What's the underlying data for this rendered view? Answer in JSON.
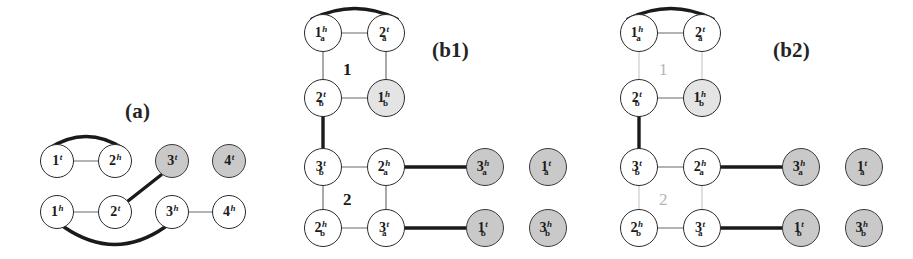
{
  "figure": {
    "background": "#ffffff",
    "colors": {
      "node_fill_white": "#ffffff",
      "node_fill_gray": "#c9c9c9",
      "node_stroke": "#2a2a2a",
      "thick_edge": "#1a1a1a",
      "thin_edge": "#9a9a9a",
      "faded_edge": "#d8d8d8",
      "faded_label": "#b4b4b4",
      "label_text": "#242424"
    }
  },
  "panels": [
    {
      "id": "a",
      "label": "(a)",
      "x": 125,
      "y": 99
    },
    {
      "id": "b1",
      "label": "(b1)",
      "x": 432,
      "y": 38
    },
    {
      "id": "b2",
      "label": "(b2)",
      "x": 773,
      "y": 38
    }
  ],
  "group_labels": [
    {
      "id": "b1-group-1",
      "text": "1",
      "x": 343,
      "y": 60,
      "color": "#1a1a1a",
      "faded": false
    },
    {
      "id": "b1-group-2",
      "text": "2",
      "x": 343,
      "y": 190,
      "color": "#1a1a1a",
      "faded": false
    },
    {
      "id": "b2-group-1",
      "text": "1",
      "x": 659,
      "y": 60,
      "color": "#b4b4b4",
      "faded": true
    },
    {
      "id": "b2-group-2",
      "text": "2",
      "x": 659,
      "y": 190,
      "color": "#b4b4b4",
      "faded": true
    }
  ],
  "nodes": [
    {
      "id": "a-1t",
      "panel": "a",
      "num": "1",
      "sup": "t",
      "sub": "",
      "cx": 57,
      "cy": 161,
      "r": 17,
      "shaded": false
    },
    {
      "id": "a-2h",
      "panel": "a",
      "num": "2",
      "sup": "h",
      "sub": "",
      "cx": 115,
      "cy": 161,
      "r": 17,
      "shaded": false
    },
    {
      "id": "a-3t",
      "panel": "a",
      "num": "3",
      "sup": "t",
      "sub": "",
      "cx": 172,
      "cy": 161,
      "r": 17,
      "shaded": true
    },
    {
      "id": "a-4t",
      "panel": "a",
      "num": "4",
      "sup": "t",
      "sub": "",
      "cx": 229,
      "cy": 161,
      "r": 17,
      "shaded": true
    },
    {
      "id": "a-1h",
      "panel": "a",
      "num": "1",
      "sup": "h",
      "sub": "",
      "cx": 57,
      "cy": 212,
      "r": 17,
      "shaded": false
    },
    {
      "id": "a-2t",
      "panel": "a",
      "num": "2",
      "sup": "t",
      "sub": "",
      "cx": 115,
      "cy": 212,
      "r": 17,
      "shaded": false
    },
    {
      "id": "a-3h",
      "panel": "a",
      "num": "3",
      "sup": "h",
      "sub": "",
      "cx": 172,
      "cy": 212,
      "r": 17,
      "shaded": false
    },
    {
      "id": "a-4h",
      "panel": "a",
      "num": "4",
      "sup": "h",
      "sub": "",
      "cx": 229,
      "cy": 212,
      "r": 17,
      "shaded": false
    },
    {
      "id": "b1-1ah",
      "panel": "b1",
      "num": "1",
      "sup": "h",
      "sub": "a",
      "cx": 323,
      "cy": 33,
      "r": 19,
      "shaded": false
    },
    {
      "id": "b1-2at",
      "panel": "b1",
      "num": "2",
      "sup": "t",
      "sub": "a",
      "cx": 386,
      "cy": 33,
      "r": 19,
      "shaded": false
    },
    {
      "id": "b1-2bt",
      "panel": "b1",
      "num": "2",
      "sup": "t",
      "sub": "b",
      "cx": 323,
      "cy": 98,
      "r": 19,
      "shaded": false
    },
    {
      "id": "b1-1bh",
      "panel": "b1",
      "num": "1",
      "sup": "h",
      "sub": "b",
      "cx": 386,
      "cy": 98,
      "r": 19,
      "shaded": false,
      "faint": true
    },
    {
      "id": "b1-3bt",
      "panel": "b1",
      "num": "3",
      "sup": "t",
      "sub": "b",
      "cx": 323,
      "cy": 167,
      "r": 19,
      "shaded": false
    },
    {
      "id": "b1-2ah",
      "panel": "b1",
      "num": "2",
      "sup": "h",
      "sub": "a",
      "cx": 386,
      "cy": 167,
      "r": 19,
      "shaded": false
    },
    {
      "id": "b1-3ah",
      "panel": "b1",
      "num": "3",
      "sup": "h",
      "sub": "a",
      "cx": 485,
      "cy": 167,
      "r": 19,
      "shaded": true
    },
    {
      "id": "b1-1at",
      "panel": "b1",
      "num": "1",
      "sup": "t",
      "sub": "a",
      "cx": 548,
      "cy": 167,
      "r": 19,
      "shaded": true
    },
    {
      "id": "b1-2bh",
      "panel": "b1",
      "num": "2",
      "sup": "h",
      "sub": "b",
      "cx": 323,
      "cy": 228,
      "r": 19,
      "shaded": false
    },
    {
      "id": "b1-3at",
      "panel": "b1",
      "num": "3",
      "sup": "t",
      "sub": "a",
      "cx": 386,
      "cy": 228,
      "r": 19,
      "shaded": false
    },
    {
      "id": "b1-1bt",
      "panel": "b1",
      "num": "1",
      "sup": "t",
      "sub": "b",
      "cx": 485,
      "cy": 228,
      "r": 19,
      "shaded": true
    },
    {
      "id": "b1-3bh",
      "panel": "b1",
      "num": "3",
      "sup": "h",
      "sub": "b",
      "cx": 548,
      "cy": 228,
      "r": 19,
      "shaded": true
    },
    {
      "id": "b2-1ah",
      "panel": "b2",
      "num": "1",
      "sup": "h",
      "sub": "a",
      "cx": 639,
      "cy": 33,
      "r": 19,
      "shaded": false
    },
    {
      "id": "b2-2at",
      "panel": "b2",
      "num": "2",
      "sup": "t",
      "sub": "a",
      "cx": 702,
      "cy": 33,
      "r": 19,
      "shaded": false
    },
    {
      "id": "b2-2bt",
      "panel": "b2",
      "num": "2",
      "sup": "t",
      "sub": "b",
      "cx": 639,
      "cy": 98,
      "r": 19,
      "shaded": false
    },
    {
      "id": "b2-1bh",
      "panel": "b2",
      "num": "1",
      "sup": "h",
      "sub": "b",
      "cx": 702,
      "cy": 98,
      "r": 19,
      "shaded": false,
      "faint": true
    },
    {
      "id": "b2-3bt",
      "panel": "b2",
      "num": "3",
      "sup": "t",
      "sub": "b",
      "cx": 639,
      "cy": 167,
      "r": 19,
      "shaded": false
    },
    {
      "id": "b2-2ah",
      "panel": "b2",
      "num": "2",
      "sup": "h",
      "sub": "a",
      "cx": 702,
      "cy": 167,
      "r": 19,
      "shaded": false
    },
    {
      "id": "b2-3ah",
      "panel": "b2",
      "num": "3",
      "sup": "h",
      "sub": "a",
      "cx": 801,
      "cy": 167,
      "r": 19,
      "shaded": true
    },
    {
      "id": "b2-1at",
      "panel": "b2",
      "num": "1",
      "sup": "t",
      "sub": "a",
      "cx": 864,
      "cy": 167,
      "r": 19,
      "shaded": true
    },
    {
      "id": "b2-2bh",
      "panel": "b2",
      "num": "2",
      "sup": "h",
      "sub": "b",
      "cx": 639,
      "cy": 228,
      "r": 19,
      "shaded": false
    },
    {
      "id": "b2-3at",
      "panel": "b2",
      "num": "3",
      "sup": "t",
      "sub": "a",
      "cx": 702,
      "cy": 228,
      "r": 19,
      "shaded": false
    },
    {
      "id": "b2-1bt",
      "panel": "b2",
      "num": "1",
      "sup": "t",
      "sub": "b",
      "cx": 801,
      "cy": 228,
      "r": 19,
      "shaded": true
    },
    {
      "id": "b2-3bh",
      "panel": "b2",
      "num": "3",
      "sup": "h",
      "sub": "b",
      "cx": 864,
      "cy": 228,
      "r": 19,
      "shaded": true
    }
  ],
  "edges": [
    {
      "id": "a-e1",
      "panel": "a",
      "kind": "thin",
      "type": "line",
      "from": [
        74,
        161
      ],
      "to": [
        98,
        161
      ]
    },
    {
      "id": "a-e2",
      "panel": "a",
      "kind": "thick",
      "type": "arc",
      "d": "M 48 149 Q 86 124 124 149"
    },
    {
      "id": "a-e3",
      "panel": "a",
      "kind": "thin",
      "type": "line",
      "from": [
        74,
        212
      ],
      "to": [
        98,
        212
      ]
    },
    {
      "id": "a-e4",
      "panel": "a",
      "kind": "thin",
      "type": "line",
      "from": [
        189,
        212
      ],
      "to": [
        212,
        212
      ]
    },
    {
      "id": "a-e5",
      "panel": "a",
      "kind": "thick",
      "type": "line",
      "from": [
        128,
        201
      ],
      "to": [
        161,
        175
      ]
    },
    {
      "id": "a-e6",
      "panel": "a",
      "kind": "thick",
      "type": "arc",
      "d": "M 64 227 Q 115 262 165 227"
    },
    {
      "id": "b1-e1",
      "panel": "b1",
      "kind": "thin",
      "type": "line",
      "from": [
        342,
        33
      ],
      "to": [
        367,
        33
      ]
    },
    {
      "id": "b1-e2",
      "panel": "b1",
      "kind": "thick",
      "type": "arc",
      "d": "M 312 19 Q 355 -2 397 19"
    },
    {
      "id": "b1-e3",
      "panel": "b1",
      "kind": "thin",
      "type": "line",
      "from": [
        323,
        52
      ],
      "to": [
        323,
        79
      ]
    },
    {
      "id": "b1-e4",
      "panel": "b1",
      "kind": "thin",
      "type": "line",
      "from": [
        386,
        52
      ],
      "to": [
        386,
        79
      ]
    },
    {
      "id": "b1-e5",
      "panel": "b1",
      "kind": "thin",
      "type": "line",
      "from": [
        342,
        98
      ],
      "to": [
        367,
        98
      ]
    },
    {
      "id": "b1-e6",
      "panel": "b1",
      "kind": "thick",
      "type": "line",
      "from": [
        323,
        117
      ],
      "to": [
        323,
        148
      ]
    },
    {
      "id": "b1-e7",
      "panel": "b1",
      "kind": "thin",
      "type": "line",
      "from": [
        342,
        167
      ],
      "to": [
        367,
        167
      ]
    },
    {
      "id": "b1-e8",
      "panel": "b1",
      "kind": "thick",
      "type": "line",
      "from": [
        405,
        167
      ],
      "to": [
        466,
        167
      ]
    },
    {
      "id": "b1-e9",
      "panel": "b1",
      "kind": "thin",
      "type": "line",
      "from": [
        323,
        186
      ],
      "to": [
        323,
        209
      ]
    },
    {
      "id": "b1-e10",
      "panel": "b1",
      "kind": "thin",
      "type": "line",
      "from": [
        386,
        186
      ],
      "to": [
        386,
        209
      ]
    },
    {
      "id": "b1-e11",
      "panel": "b1",
      "kind": "thin",
      "type": "line",
      "from": [
        342,
        228
      ],
      "to": [
        367,
        228
      ]
    },
    {
      "id": "b1-e12",
      "panel": "b1",
      "kind": "thick",
      "type": "line",
      "from": [
        405,
        228
      ],
      "to": [
        466,
        228
      ]
    },
    {
      "id": "b2-e1",
      "panel": "b2",
      "kind": "thin",
      "type": "line",
      "from": [
        658,
        33
      ],
      "to": [
        683,
        33
      ]
    },
    {
      "id": "b2-e2",
      "panel": "b2",
      "kind": "thick",
      "type": "arc",
      "d": "M 628 19 Q 671 -2 713 19"
    },
    {
      "id": "b2-e3",
      "panel": "b2",
      "kind": "faded",
      "type": "line",
      "from": [
        639,
        52
      ],
      "to": [
        639,
        79
      ]
    },
    {
      "id": "b2-e4",
      "panel": "b2",
      "kind": "faded",
      "type": "line",
      "from": [
        702,
        52
      ],
      "to": [
        702,
        79
      ]
    },
    {
      "id": "b2-e5",
      "panel": "b2",
      "kind": "thin",
      "type": "line",
      "from": [
        658,
        98
      ],
      "to": [
        683,
        98
      ]
    },
    {
      "id": "b2-e6",
      "panel": "b2",
      "kind": "thick",
      "type": "line",
      "from": [
        639,
        117
      ],
      "to": [
        639,
        148
      ]
    },
    {
      "id": "b2-e7",
      "panel": "b2",
      "kind": "thin",
      "type": "line",
      "from": [
        658,
        167
      ],
      "to": [
        683,
        167
      ]
    },
    {
      "id": "b2-e8",
      "panel": "b2",
      "kind": "thick",
      "type": "line",
      "from": [
        721,
        167
      ],
      "to": [
        782,
        167
      ]
    },
    {
      "id": "b2-e9",
      "panel": "b2",
      "kind": "faded",
      "type": "line",
      "from": [
        639,
        186
      ],
      "to": [
        639,
        209
      ]
    },
    {
      "id": "b2-e10",
      "panel": "b2",
      "kind": "faded",
      "type": "line",
      "from": [
        702,
        186
      ],
      "to": [
        702,
        209
      ]
    },
    {
      "id": "b2-e11",
      "panel": "b2",
      "kind": "thin",
      "type": "line",
      "from": [
        658,
        228
      ],
      "to": [
        683,
        228
      ]
    },
    {
      "id": "b2-e12",
      "panel": "b2",
      "kind": "thick",
      "type": "line",
      "from": [
        721,
        228
      ],
      "to": [
        782,
        228
      ]
    }
  ]
}
